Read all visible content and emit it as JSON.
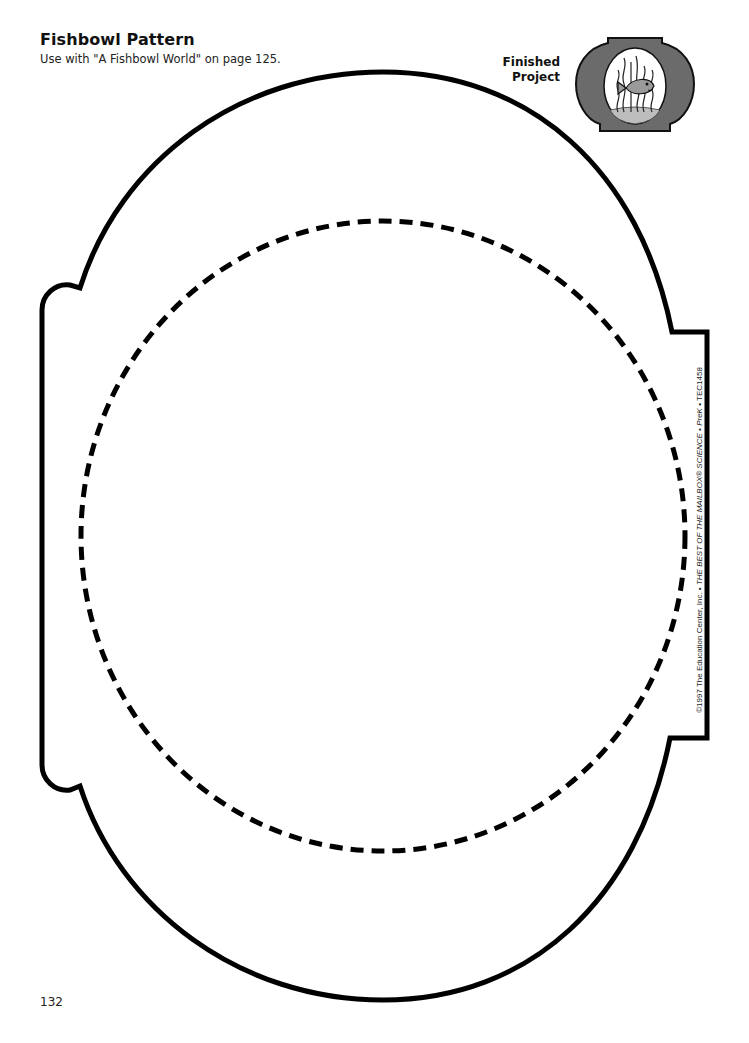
{
  "header": {
    "title": "Fishbowl Pattern",
    "subtitle": "Use with \"A Fishbowl World\" on page 125."
  },
  "finished_project": {
    "label_line1": "Finished",
    "label_line2": "Project",
    "icon": "fishbowl-with-fish-icon"
  },
  "pattern": {
    "outline": "solid-bowl-outline",
    "cut_line": "dashed-circle-cut-line"
  },
  "footer": {
    "copyright_prefix": "©1997 The Education Center, Inc. • ",
    "copyright_title": "THE BEST OF THE MAILBOX® SCIENCE • PreK",
    "copyright_suffix": " • TEC1458",
    "page_number": "132"
  },
  "colors": {
    "line": "#000000",
    "thumb_bowl": "#6b6b6b",
    "thumb_fish": "#9a9a9a",
    "thumb_gravel": "#bdbdbd"
  }
}
